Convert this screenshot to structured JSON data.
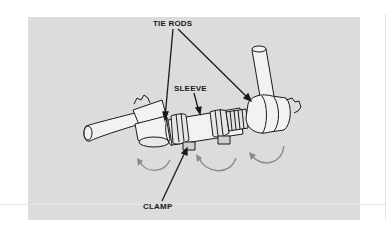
{
  "figure": {
    "labels": {
      "tie_rods": "TIE RODS",
      "sleeve": "SLEEVE",
      "clamp": "CLAMP"
    },
    "colors": {
      "panel_background": "#dcdcdc",
      "part_fill": "#f2f2f2",
      "outline": "#1a1a1a",
      "rotation_arrows": "#8a8a8a"
    },
    "components": [
      "tie rod end (left)",
      "clamp (left)",
      "sleeve",
      "clamp (right)",
      "tie rod end (right)"
    ],
    "rotation_arrows_count": 3
  }
}
